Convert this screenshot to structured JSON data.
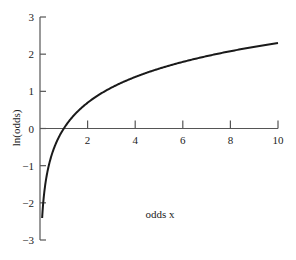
{
  "chart_data": {
    "type": "line",
    "title": "",
    "xlabel": "odds x",
    "ylabel": "ln(odds)",
    "xlim": [
      0,
      10
    ],
    "ylim": [
      -3,
      3
    ],
    "grid": false,
    "legend": null,
    "x_ticks": [
      2,
      4,
      6,
      8,
      10
    ],
    "x_tick_labels": [
      "2",
      "4",
      "6",
      "8",
      "10"
    ],
    "y_ticks": [
      -3,
      -2,
      -1,
      0,
      1,
      2,
      3
    ],
    "y_tick_labels": [
      "−3",
      "−2",
      "−1",
      "0",
      "1",
      "2",
      "3"
    ],
    "series": [
      {
        "name": "ln(x)",
        "function": "ln(x)",
        "x": [
          0.09,
          0.15,
          0.25,
          0.5,
          0.75,
          1,
          1.5,
          2,
          3,
          4,
          5,
          6,
          7,
          8,
          9,
          10
        ],
        "y": [
          -2.41,
          -1.9,
          -1.39,
          -0.69,
          -0.29,
          0,
          0.41,
          0.69,
          1.1,
          1.39,
          1.61,
          1.79,
          1.95,
          2.08,
          2.2,
          2.3
        ]
      }
    ],
    "colors": {
      "curve": "#1a1a1a",
      "axis": "#555555"
    }
  }
}
